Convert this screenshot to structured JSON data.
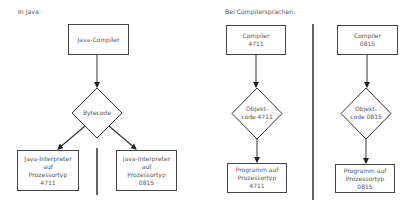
{
  "left_panel": {
    "heading": "In Java:",
    "compiler": {
      "label": "Java-Compiler"
    },
    "bytecode": {
      "label": "Bytecode"
    },
    "interpreter_a": {
      "lines": [
        "Java-Interpreter",
        "auf",
        "Prozessortyp",
        "4711"
      ]
    },
    "interpreter_b": {
      "lines": [
        "Java-Interpreter",
        "auf",
        "Prozessortyp",
        "0815"
      ]
    }
  },
  "right_panel": {
    "heading": "Bei Compilersprachen:",
    "column_a": {
      "compiler": {
        "lines": [
          "Compiler",
          "4711"
        ]
      },
      "objectcode": {
        "lines": [
          "Objekt-",
          "code 4711"
        ]
      },
      "program": {
        "lines": [
          "Programm auf",
          "Prozessortyp",
          "4711"
        ]
      }
    },
    "column_b": {
      "compiler": {
        "lines": [
          "Compiler",
          "0815"
        ]
      },
      "objectcode": {
        "lines": [
          "Objekt-",
          "code 0815"
        ]
      },
      "program": {
        "lines": [
          "Programm auf",
          "Prozessortyp",
          "0815"
        ]
      }
    }
  },
  "colors": {
    "stroke": "#333333",
    "text": "#555555",
    "background": "#ffffff"
  }
}
